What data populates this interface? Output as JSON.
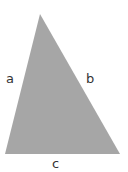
{
  "diagram": {
    "shape": "triangle",
    "fill": "#a6a6a6",
    "vertices": [
      [
        40,
        14
      ],
      [
        5,
        154
      ],
      [
        120,
        154
      ]
    ],
    "labels": {
      "a": "a",
      "b": "b",
      "c": "c"
    }
  }
}
